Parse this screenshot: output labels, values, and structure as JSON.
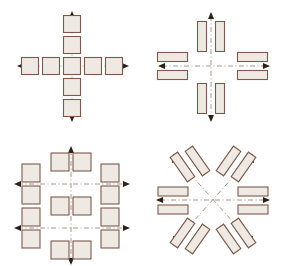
{
  "figure": {
    "background_color": "#ffffff",
    "block_fill_color": "#efe9e3",
    "block_stroke_color": "#7a5a4e",
    "axis_color": "#9b8b86",
    "arrow_color": "#2b2018",
    "panel_count": 4,
    "panel_layout": "2x2 grid"
  },
  "panels": [
    {
      "id": "top-left",
      "name": "cross-of-squares",
      "description": "Nine square blocks forming a plus/cross, five along the horizontal arm and five along the vertical arm sharing one central square",
      "axes": [
        {
          "orientation": "horizontal",
          "arrowheads": "both"
        },
        {
          "orientation": "vertical",
          "arrowheads": "both"
        }
      ],
      "block_shape": "square",
      "block_count": 9,
      "blocks": [
        {
          "cx": 30,
          "cy": 66,
          "w": 17,
          "h": 17,
          "rot": 0
        },
        {
          "cx": 51,
          "cy": 66,
          "w": 17,
          "h": 17,
          "rot": 0
        },
        {
          "cx": 72,
          "cy": 66,
          "w": 17,
          "h": 17,
          "rot": 0
        },
        {
          "cx": 93,
          "cy": 66,
          "w": 17,
          "h": 17,
          "rot": 0
        },
        {
          "cx": 114,
          "cy": 66,
          "w": 17,
          "h": 17,
          "rot": 0
        },
        {
          "cx": 72,
          "cy": 24,
          "w": 17,
          "h": 17,
          "rot": 0
        },
        {
          "cx": 72,
          "cy": 45,
          "w": 17,
          "h": 17,
          "rot": 0
        },
        {
          "cx": 72,
          "cy": 87,
          "w": 17,
          "h": 17,
          "rot": 0
        },
        {
          "cx": 72,
          "cy": 108,
          "w": 17,
          "h": 17,
          "rot": 0
        }
      ]
    },
    {
      "id": "top-right",
      "name": "paired-bars-on-orthogonal-axes",
      "description": "Eight elongated rectangular bars in four pairs, one pair straddling each of the four axis directions; bars on the vertical axis stand upright, bars on the horizontal axis lie flat",
      "axes": [
        {
          "orientation": "horizontal",
          "arrowheads": "both"
        },
        {
          "orientation": "vertical",
          "arrowheads": "both"
        }
      ],
      "block_shape": "elongated rectangle",
      "block_count": 8,
      "blocks": [
        {
          "cx": 60,
          "cy": 36,
          "w": 9,
          "h": 30,
          "rot": 0
        },
        {
          "cx": 78,
          "cy": 36,
          "w": 9,
          "h": 30,
          "rot": 0
        },
        {
          "cx": 60,
          "cy": 98,
          "w": 9,
          "h": 30,
          "rot": 0
        },
        {
          "cx": 78,
          "cy": 98,
          "w": 9,
          "h": 30,
          "rot": 0
        },
        {
          "cx": 30,
          "cy": 57,
          "w": 30,
          "h": 9,
          "rot": 0
        },
        {
          "cx": 30,
          "cy": 75,
          "w": 30,
          "h": 9,
          "rot": 0
        },
        {
          "cx": 110,
          "cy": 57,
          "w": 30,
          "h": 9,
          "rot": 0
        },
        {
          "cx": 110,
          "cy": 75,
          "w": 30,
          "h": 9,
          "rot": 0
        }
      ]
    },
    {
      "id": "bottom-left",
      "name": "grid-of-squares-dual-axes",
      "description": "Twelve square blocks arranged in an open grid about two horizontal axes and one vertical axis; four blocks in the left column, four in the right column, and two-by-two pairs along the vertical centre",
      "axes": [
        {
          "orientation": "horizontal-upper",
          "arrowheads": "both"
        },
        {
          "orientation": "horizontal-lower",
          "arrowheads": "both"
        },
        {
          "orientation": "vertical",
          "arrowheads": "both"
        }
      ],
      "block_shape": "square",
      "block_count": 12,
      "blocks": [
        {
          "cx": 31,
          "cy": 40,
          "w": 18,
          "h": 18,
          "rot": 0
        },
        {
          "cx": 31,
          "cy": 62,
          "w": 18,
          "h": 18,
          "rot": 0
        },
        {
          "cx": 31,
          "cy": 84,
          "w": 18,
          "h": 18,
          "rot": 0
        },
        {
          "cx": 31,
          "cy": 106,
          "w": 18,
          "h": 18,
          "rot": 0
        },
        {
          "cx": 110,
          "cy": 40,
          "w": 18,
          "h": 18,
          "rot": 0
        },
        {
          "cx": 110,
          "cy": 62,
          "w": 18,
          "h": 18,
          "rot": 0
        },
        {
          "cx": 110,
          "cy": 84,
          "w": 18,
          "h": 18,
          "rot": 0
        },
        {
          "cx": 110,
          "cy": 106,
          "w": 18,
          "h": 18,
          "rot": 0
        },
        {
          "cx": 60,
          "cy": 29,
          "w": 18,
          "h": 18,
          "rot": 0
        },
        {
          "cx": 82,
          "cy": 29,
          "w": 18,
          "h": 18,
          "rot": 0
        },
        {
          "cx": 60,
          "cy": 73,
          "w": 18,
          "h": 18,
          "rot": 0
        },
        {
          "cx": 82,
          "cy": 73,
          "w": 18,
          "h": 18,
          "rot": 0
        },
        {
          "cx": 60,
          "cy": 117,
          "w": 18,
          "h": 18,
          "rot": 0
        },
        {
          "cx": 82,
          "cy": 117,
          "w": 18,
          "h": 18,
          "rot": 0
        }
      ]
    },
    {
      "id": "bottom-right",
      "name": "radial-bars-diagonal-axes",
      "description": "Twelve elongated bars in six pairs radiating about a common centre: one pair along each diagonal of an X-shaped pair of axes and one pair on each side of the horizontal axis",
      "axes": [
        {
          "orientation": "horizontal",
          "arrowheads": "both"
        },
        {
          "orientation": "diagonal-45",
          "arrowheads": "both"
        },
        {
          "orientation": "diagonal-135",
          "arrowheads": "both"
        }
      ],
      "block_shape": "elongated rectangle",
      "block_count": 12,
      "blocks": [
        {
          "cx": 30,
          "cy": 58,
          "w": 30,
          "h": 9,
          "rot": 0
        },
        {
          "cx": 30,
          "cy": 76,
          "w": 30,
          "h": 9,
          "rot": 0
        },
        {
          "cx": 111,
          "cy": 58,
          "w": 30,
          "h": 9,
          "rot": 0
        },
        {
          "cx": 111,
          "cy": 76,
          "w": 30,
          "h": 9,
          "rot": 0
        },
        {
          "cx": 45,
          "cy": 32,
          "w": 9,
          "h": 30,
          "rot": -35
        },
        {
          "cx": 60,
          "cy": 26,
          "w": 9,
          "h": 30,
          "rot": -35
        },
        {
          "cx": 96,
          "cy": 32,
          "w": 9,
          "h": 30,
          "rot": 35
        },
        {
          "cx": 81,
          "cy": 26,
          "w": 9,
          "h": 30,
          "rot": 35
        },
        {
          "cx": 45,
          "cy": 102,
          "w": 9,
          "h": 30,
          "rot": 35
        },
        {
          "cx": 60,
          "cy": 108,
          "w": 9,
          "h": 30,
          "rot": 35
        },
        {
          "cx": 96,
          "cy": 102,
          "w": 9,
          "h": 30,
          "rot": -35
        },
        {
          "cx": 81,
          "cy": 108,
          "w": 9,
          "h": 30,
          "rot": -35
        }
      ]
    }
  ]
}
